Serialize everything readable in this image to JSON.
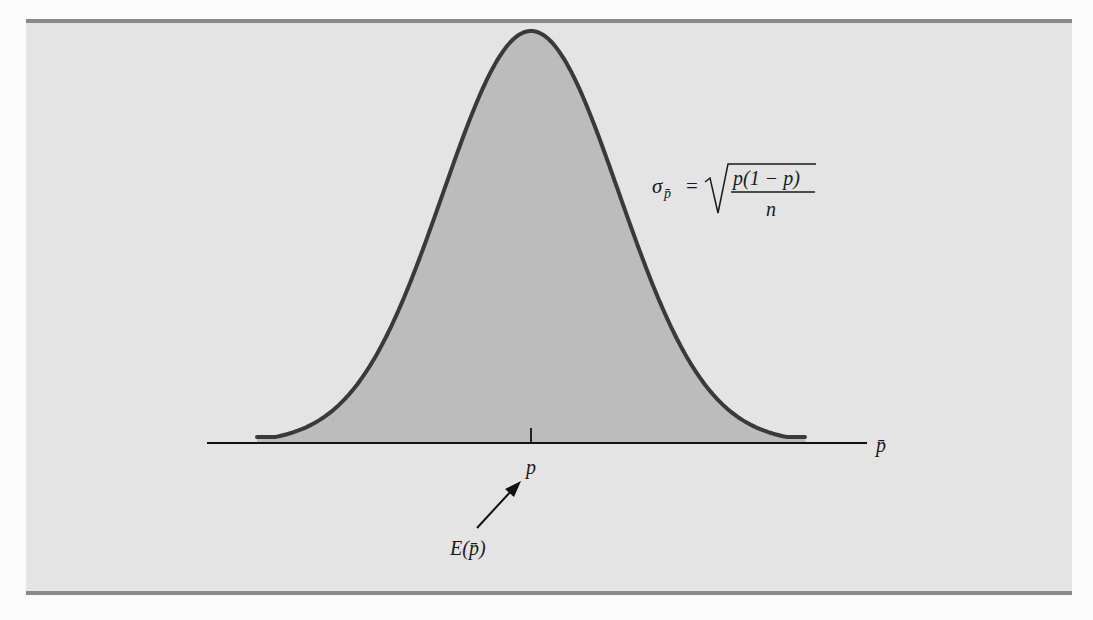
{
  "figure": {
    "type": "sampling-distribution-diagram",
    "axis_label": "p̄",
    "center_label": "p",
    "expected_value_label": "E(p̄)",
    "formula": {
      "lhs": "σ",
      "lhs_subscript": "p̄",
      "equals": "=",
      "numerator": "p(1 − p)",
      "denominator": "n"
    },
    "colors": {
      "panel_background": "#e4e4e4",
      "panel_border": "#8a8a8a",
      "curve_fill": "#bcbcbc",
      "curve_stroke": "#3a3a3a",
      "axis": "#111111"
    }
  }
}
